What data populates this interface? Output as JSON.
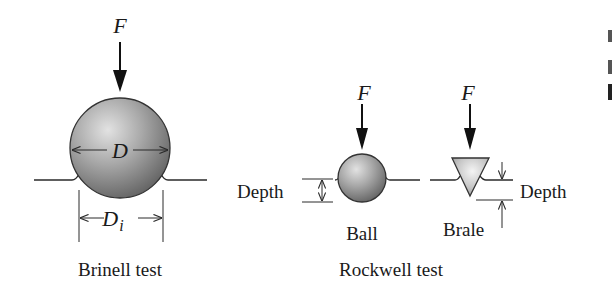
{
  "diagram": {
    "brinell": {
      "force_label": "F",
      "diameter_label": "D",
      "impression_label": "D",
      "impression_subscript": "i",
      "caption": "Brinell test"
    },
    "rockwell": {
      "caption": "Rockwell test",
      "ball": {
        "force_label": "F",
        "depth_label": "Depth",
        "indenter_label": "Ball"
      },
      "brale": {
        "force_label": "F",
        "depth_label": "Depth",
        "indenter_label": "Brale"
      }
    },
    "colors": {
      "ink": "#1a1a1a",
      "sphere_light": "#d8d8d8",
      "sphere_dark": "#6e6e6e",
      "brale_light": "#efefef",
      "brale_dark": "#9a9a9a"
    }
  }
}
